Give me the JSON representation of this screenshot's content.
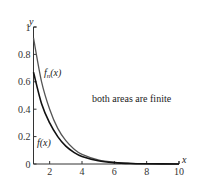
{
  "chart_data": {
    "type": "line",
    "title": "",
    "xlabel": "x",
    "ylabel": "y",
    "xlim": [
      1,
      10
    ],
    "ylim": [
      0,
      1
    ],
    "x_ticks": [
      2,
      4,
      6,
      8,
      10
    ],
    "y_ticks": [
      0,
      0.2,
      0.4,
      0.6,
      0.8,
      1
    ],
    "y_tick_labels": [
      "0",
      "0.2",
      "0.4",
      "0.6",
      "0.8",
      "1"
    ],
    "grid": false,
    "annotation": "both areas are finite",
    "series": [
      {
        "name": "f_n(x)",
        "label_main": "f",
        "label_sub": "n",
        "label_tail": "(x)",
        "color": "#555555",
        "x": [
          1,
          1.5,
          2,
          2.5,
          3,
          3.5,
          4,
          5,
          6,
          7,
          8,
          10
        ],
        "values": [
          0.92,
          0.6,
          0.4,
          0.26,
          0.17,
          0.11,
          0.07,
          0.03,
          0.012,
          0.005,
          0.002,
          0.0
        ]
      },
      {
        "name": "f(x)",
        "label_main": "f(x)",
        "color": "#111111",
        "x": [
          1,
          1.5,
          2,
          2.5,
          3,
          3.5,
          4,
          5,
          6,
          7,
          8,
          10
        ],
        "values": [
          0.67,
          0.44,
          0.3,
          0.2,
          0.13,
          0.085,
          0.055,
          0.024,
          0.01,
          0.004,
          0.002,
          0.0
        ]
      }
    ]
  }
}
